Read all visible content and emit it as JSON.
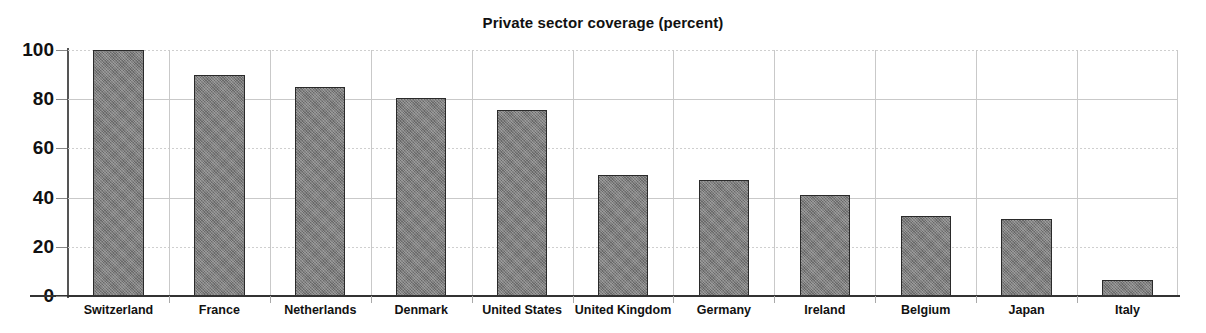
{
  "chart_data": {
    "type": "bar",
    "title": "Private sector coverage (percent)",
    "xlabel": "",
    "ylabel": "",
    "ylim": [
      0,
      100
    ],
    "yticks": [
      0,
      20,
      40,
      60,
      80,
      100
    ],
    "ytick_labels": [
      "0",
      "20",
      "40",
      "60",
      "80",
      "100"
    ],
    "grid": "both",
    "legend": "none",
    "categories": [
      "Switzerland",
      "France",
      "Netherlands",
      "Denmark",
      "United States",
      "United Kingdom",
      "Germany",
      "Ireland",
      "Belgium",
      "Japan",
      "Italy"
    ],
    "values": [
      100,
      90,
      85,
      80.5,
      75.5,
      49,
      47,
      41,
      32.5,
      31.5,
      6.5
    ],
    "bar_color": "#7d7d7d",
    "bar_border_color": "#2a2a2a",
    "grid_color": "#c9c9c9",
    "axis_color": "#333333",
    "background_color": "#ffffff"
  }
}
